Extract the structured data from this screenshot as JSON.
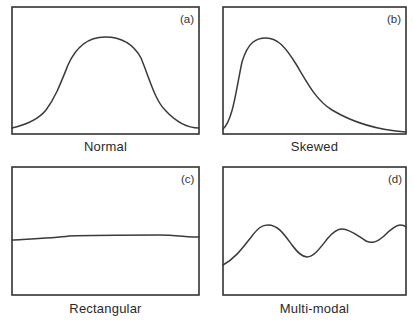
{
  "figure": {
    "panels": [
      {
        "id": "a",
        "tag": "(a)",
        "caption": "Normal"
      },
      {
        "id": "b",
        "tag": "(b)",
        "caption": "Skewed"
      },
      {
        "id": "c",
        "tag": "(c)",
        "caption": "Rectangular"
      },
      {
        "id": "d",
        "tag": "(d)",
        "caption": "Multi-modal"
      }
    ]
  },
  "colors": {
    "line": "#3a3a3a",
    "frame": "#333333",
    "background": "#ffffff"
  }
}
